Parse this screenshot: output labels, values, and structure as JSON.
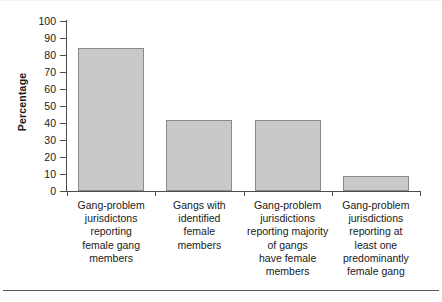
{
  "chart_data": {
    "type": "bar",
    "title": "",
    "xlabel": "",
    "ylabel": "Percentage",
    "ylim": [
      0,
      100
    ],
    "ytick_labels": [
      "100",
      "90",
      "80",
      "70",
      "60",
      "50",
      "40",
      "30",
      "20",
      "10",
      "0"
    ],
    "yticks": [
      100,
      90,
      80,
      70,
      60,
      50,
      40,
      30,
      20,
      10,
      0
    ],
    "grid": false,
    "legend": "none",
    "bar_color": "#c9c9c9",
    "bar_edge_color": "#8a8a8a",
    "categories": [
      "Gang-problem jurisdictons reporting female gang members",
      "Gangs with identified female members",
      "Gang-problem jurisdictions reporting majority of gangs have female members",
      "Gang-problem jurisdictions reporting at least one predominantly female gang"
    ],
    "category_lines": [
      [
        "Gang-problem",
        "jurisdictons",
        "reporting",
        "female gang",
        "members"
      ],
      [
        "Gangs with",
        "identified",
        "female",
        "members"
      ],
      [
        "Gang-problem",
        "jurisdictions",
        "reporting majority",
        "of gangs",
        "have female",
        "members"
      ],
      [
        "Gang-problem",
        "jurisdictions",
        "reporting at",
        "least one",
        "predominantly",
        "female gang"
      ]
    ],
    "values": [
      84,
      42,
      42,
      9
    ]
  }
}
